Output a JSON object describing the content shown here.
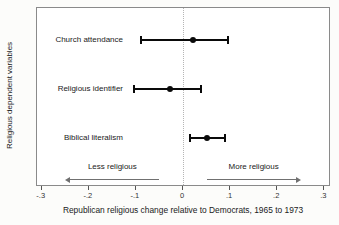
{
  "chart_data": {
    "type": "scatter",
    "subtype": "coefficient-plot-with-ci",
    "orientation": "horizontal",
    "title": "",
    "xlabel": "Republican religious change relative to Democrats, 1965 to 1973",
    "ylabel": "Religious dependent variables",
    "xlim": [
      -0.3,
      0.3
    ],
    "grid": false,
    "reference_line_x": 0,
    "xticks": [
      {
        "value": -0.3,
        "label": "-.3"
      },
      {
        "value": -0.2,
        "label": "-.2"
      },
      {
        "value": -0.1,
        "label": "-.1"
      },
      {
        "value": 0,
        "label": "0"
      },
      {
        "value": 0.1,
        "label": ".1"
      },
      {
        "value": 0.2,
        "label": ".2"
      },
      {
        "value": 0.3,
        "label": ".3"
      }
    ],
    "points": [
      {
        "category": "Church attendance",
        "estimate": 0.021,
        "ci_low": -0.089,
        "ci_high": 0.095
      },
      {
        "category": "Religious identifier",
        "estimate": -0.028,
        "ci_low": -0.103,
        "ci_high": 0.039
      },
      {
        "category": "Biblical literalism",
        "estimate": 0.051,
        "ci_low": 0.014,
        "ci_high": 0.089
      }
    ],
    "annotations": [
      {
        "text": "Less religious",
        "direction": "left",
        "x_from": -0.25,
        "x_to": -0.05
      },
      {
        "text": "More religious",
        "direction": "right",
        "x_from": 0.05,
        "x_to": 0.25
      }
    ],
    "colors": {
      "data": "#0a0a0a",
      "reference_line": "#b5b5b5",
      "arrow": "#707070",
      "frame": "#8a8a8a",
      "plot_background": "#ffffff"
    }
  }
}
